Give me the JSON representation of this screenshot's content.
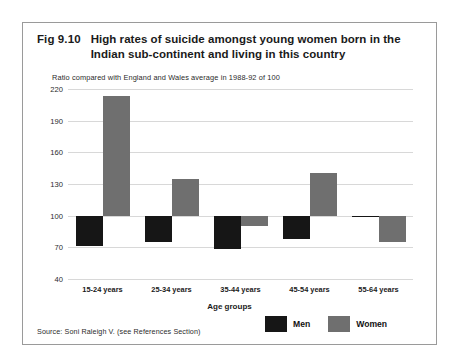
{
  "figure": {
    "number": "Fig 9.10",
    "title": "High rates of suicide amongst young women born in the Indian sub-continent and living in this country",
    "subtitle": "Ratio compared with England and Wales average in 1988-92 of 100",
    "source": "Source: Soni Raleigh V. (see References Section)"
  },
  "legend": {
    "men_label": "Men",
    "women_label": "Women"
  },
  "colors": {
    "men": "#161616",
    "women": "#6f6f6f",
    "grid": "#d8d8d8",
    "frame": "#9a9a9a",
    "text": "#1a1a1a"
  },
  "chart_data": {
    "type": "bar",
    "title": "High rates of suicide amongst young women born in the Indian sub-continent and living in this country",
    "subtitle": "Ratio compared with England and Wales average in 1988-92 of 100",
    "xlabel": "Age groups",
    "ylabel": "",
    "ylim": [
      40,
      220
    ],
    "yticks": [
      40,
      70,
      100,
      130,
      160,
      190,
      220
    ],
    "baseline": 100,
    "grid": true,
    "legend_position": "bottom-right",
    "categories": [
      "15-24 years",
      "25-34 years",
      "35-44 years",
      "45-54 years",
      "55-64 years"
    ],
    "series": [
      {
        "name": "Men",
        "values": [
          71,
          75,
          68,
          78,
          100
        ]
      },
      {
        "name": "Women",
        "values": [
          213,
          135,
          90,
          140,
          75
        ]
      }
    ]
  }
}
